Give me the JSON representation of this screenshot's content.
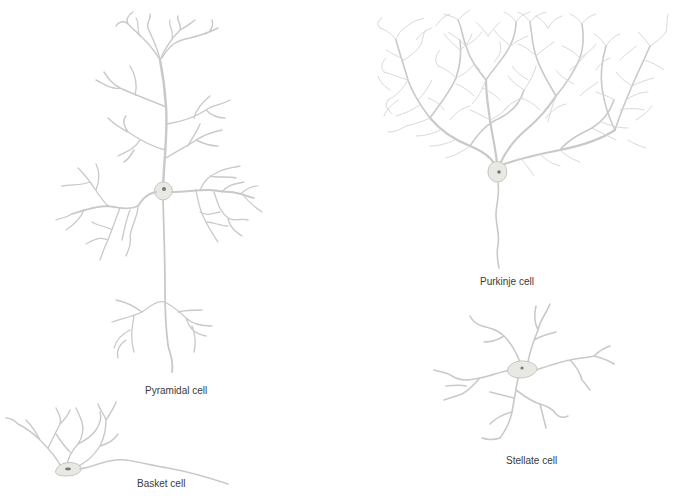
{
  "figure": {
    "cells": [
      {
        "id": "pyramidal",
        "label": "Pyramidal cell"
      },
      {
        "id": "purkinje",
        "label": "Purkinje cell"
      },
      {
        "id": "stellate",
        "label": "Stellate cell"
      },
      {
        "id": "basket",
        "label": "Basket cell"
      }
    ],
    "colors": {
      "dendrite": "#c9c9c9",
      "soma_fill": "#e9e9e4",
      "nucleus": "#777777",
      "label_text": "#3a3a3a",
      "background": "#ffffff"
    }
  }
}
